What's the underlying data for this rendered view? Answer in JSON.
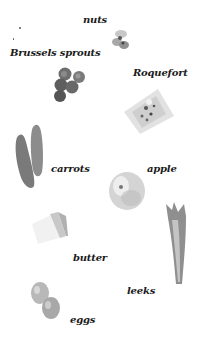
{
  "labels": {
    "nuts": "nuts",
    "brussels_sprouts": "Brussels sprouts",
    "roquefort": "Roquefort",
    "carrots": "carrots",
    "apple": "apple",
    "butter": "butter",
    "leeks": "leeks",
    "eggs": "eggs"
  },
  "colors": {
    "background": "#ffffff",
    "text": "#1a1a1a"
  }
}
